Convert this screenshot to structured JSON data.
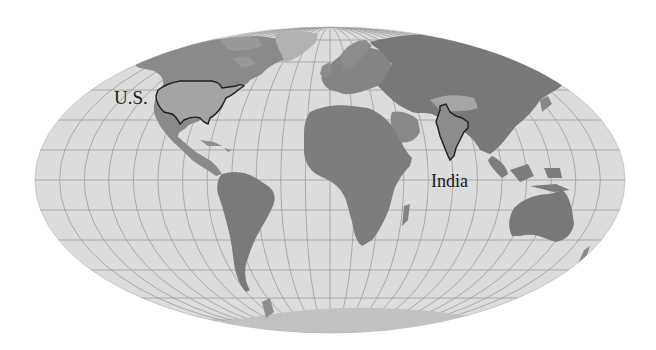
{
  "map": {
    "projection": "Mollweide",
    "style": "grayscale shaded-relief world map with graticule",
    "colors": {
      "background": "#ffffff",
      "ocean": "#dcdcdc",
      "graticule": "#9a9a9a",
      "land_low": "#8a8a8a",
      "land_mid": "#767676",
      "land_high": "#b8b8b8",
      "antarctica": "#c4c4c4",
      "outline": "#1e1e1e",
      "label": "#1a1a1a"
    },
    "graticule": {
      "parallel_step_deg": 15,
      "meridian_step_deg": 15
    },
    "highlighted_regions": [
      {
        "id": "us",
        "name": "United States (contiguous)"
      },
      {
        "id": "india",
        "name": "India"
      }
    ],
    "labels": {
      "us": "U.S.",
      "india": "India"
    }
  }
}
